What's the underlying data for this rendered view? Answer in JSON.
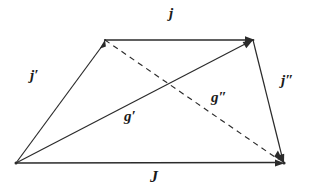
{
  "figure": {
    "type": "vector-quadrilateral-diagram",
    "background_color": "#ffffff",
    "stroke_color": "#2b2b2b",
    "label_color": "#1a1a1a",
    "labels": {
      "top_edge": "j",
      "left_edge": "j′",
      "right_edge": "j″",
      "bottom_edge": "J",
      "diagonal_solid": "g′",
      "diagonal_dashed": "g″"
    },
    "vertices": {
      "bottom_left": [
        16,
        163
      ],
      "top_left": [
        105,
        40
      ],
      "top_right": [
        253,
        40
      ],
      "bottom_right": [
        284,
        163
      ]
    },
    "segments": [
      {
        "name": "top-edge-vector-j",
        "label": "j",
        "style": "solid",
        "from": "top_left",
        "to": "top_right",
        "arrowhead_at": "to"
      },
      {
        "name": "left-edge-vector-j-prime",
        "label": "j′",
        "style": "solid",
        "from": "bottom_left",
        "to": "top_left",
        "arrowhead_at": "to"
      },
      {
        "name": "right-edge-vector-j-double-prime",
        "label": "j″",
        "style": "solid",
        "from": "top_right",
        "to": "bottom_right",
        "arrowhead_at": "to"
      },
      {
        "name": "bottom-edge-vector-J",
        "label": "J",
        "style": "solid",
        "from": "bottom_left",
        "to": "bottom_right",
        "arrowhead_at": "to"
      },
      {
        "name": "diagonal-vector-g-prime",
        "label": "g′",
        "style": "solid",
        "from": "bottom_left",
        "to": "top_right",
        "arrowhead_at": "to"
      },
      {
        "name": "diagonal-vector-g-double-prime",
        "label": "g″",
        "style": "dashed",
        "from": "top_left",
        "to": "bottom_right",
        "arrowhead_at": "to"
      }
    ]
  }
}
